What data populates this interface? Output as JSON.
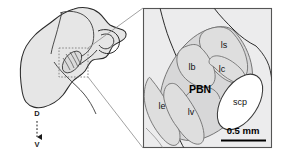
{
  "figure": {
    "background_color": "#ffffff"
  },
  "colors": {
    "panel_fill": "#ececed",
    "brain_fill": "#e6e6e6",
    "region_fill": "#d7d7d8",
    "region_fill_light": "#dedede",
    "scp_fill": "#ffffff",
    "outline": "#2b2b2b",
    "inner_outline": "#7a7a7a",
    "panel_border": "#555555",
    "inset_box": "#777777",
    "connector": "#8a8a8a",
    "label_text": "#111111",
    "scale_bar": "#000000"
  },
  "overview_panel": {
    "name": "sagittal-brain-section",
    "inset_box": {
      "label": "inset-region",
      "x": 59,
      "y": 48,
      "width": 29,
      "height": 29,
      "style": "dotted"
    },
    "orientation_axis": {
      "name": "dorsal-ventral-axis",
      "top_label": "D",
      "bottom_label": "V",
      "arrow_direction": "down",
      "x": 37,
      "top_y": 112,
      "bottom_y": 146
    }
  },
  "detail_panel": {
    "name": "parabrachial-nucleus-detail",
    "border": {
      "x": 143,
      "y": 8,
      "width": 129,
      "height": 140
    },
    "main_label": {
      "text": "PBN",
      "x": 200,
      "y": 90,
      "bold": true
    },
    "subregions": [
      {
        "id": "ls",
        "label": "ls",
        "x": 224,
        "y": 46,
        "description": "lateral superior subnucleus"
      },
      {
        "id": "lb",
        "label": "lb",
        "x": 192,
        "y": 68,
        "description": "lateral external-dorsal subnucleus"
      },
      {
        "id": "lc",
        "label": "lc",
        "x": 222,
        "y": 70,
        "description": "lateral central subnucleus"
      },
      {
        "id": "le",
        "label": "le",
        "x": 162,
        "y": 107,
        "description": "lateral external subnucleus"
      },
      {
        "id": "lv",
        "label": "lv",
        "x": 191,
        "y": 113,
        "description": "lateral ventral subnucleus"
      },
      {
        "id": "scp",
        "label": "scp",
        "x": 240,
        "y": 103,
        "description": "superior cerebellar peduncle"
      }
    ],
    "scale_bar": {
      "name": "scale-bar",
      "text": "0.5 mm",
      "x1": 221,
      "x2": 266,
      "y": 141,
      "label_x": 243,
      "label_y": 131
    }
  },
  "connectors": [
    {
      "name": "connector-upper",
      "x1": 88,
      "y1": 48,
      "x2": 143,
      "y2": 8
    },
    {
      "name": "connector-lower",
      "x1": 88,
      "y1": 77,
      "x2": 143,
      "y2": 148
    }
  ]
}
